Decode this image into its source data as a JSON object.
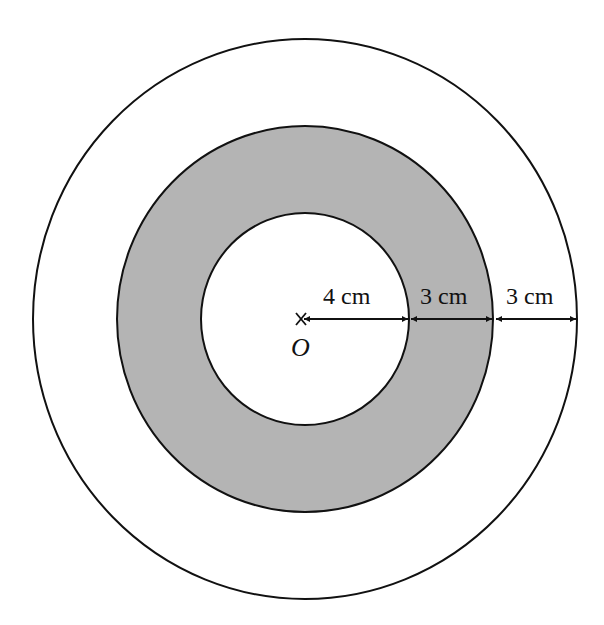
{
  "diagram": {
    "center_label": "O",
    "colors": {
      "ring_fill": "#b4b4b4",
      "stroke": "#111111",
      "background": "#ffffff"
    },
    "circles": [
      {
        "name": "outer",
        "radius_cm": 10
      },
      {
        "name": "middle",
        "radius_cm": 7,
        "shaded": true
      },
      {
        "name": "inner",
        "radius_cm": 4
      }
    ],
    "dimensions": [
      {
        "label": "4 cm",
        "from": "O",
        "to": "inner circle"
      },
      {
        "label": "3 cm",
        "from": "inner circle",
        "to": "middle circle"
      },
      {
        "label": "3 cm",
        "from": "middle circle",
        "to": "outer circle"
      }
    ]
  }
}
